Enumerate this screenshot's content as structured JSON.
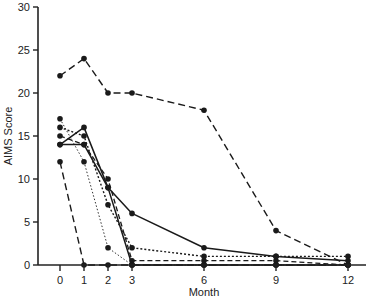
{
  "chart_data": {
    "type": "line",
    "title": "",
    "xlabel": "Month",
    "ylabel": "AIMS Score",
    "x": [
      0,
      1,
      2,
      3,
      6,
      9,
      12
    ],
    "x_ticks": [
      0,
      1,
      2,
      3,
      6,
      9,
      12
    ],
    "y_ticks": [
      0,
      5,
      10,
      15,
      20,
      25,
      30
    ],
    "ylim": [
      0,
      30
    ],
    "xlim": [
      -0.9,
      13
    ],
    "grid": false,
    "legend": null,
    "series": [
      {
        "name": "Patient A",
        "style": "longdash",
        "values": [
          22,
          24,
          20,
          20,
          18,
          4,
          0
        ]
      },
      {
        "name": "Patient B",
        "style": "solid",
        "values": [
          14,
          14,
          9,
          6,
          2,
          1,
          0.5
        ]
      },
      {
        "name": "Patient C",
        "style": "solid",
        "values": [
          14,
          16,
          9,
          0,
          0,
          0,
          0
        ]
      },
      {
        "name": "Patient D",
        "style": "dotted",
        "values": [
          16,
          15,
          7,
          2,
          1,
          1,
          1
        ]
      },
      {
        "name": "Patient E",
        "style": "thindotted",
        "values": [
          17,
          12,
          2,
          0,
          0,
          0,
          0
        ]
      },
      {
        "name": "Patient F",
        "style": "dash",
        "values": [
          15,
          14,
          10,
          0.5,
          0.5,
          0.5,
          0
        ]
      },
      {
        "name": "Patient G",
        "style": "longdash",
        "values": [
          12,
          0,
          0,
          0,
          0,
          0,
          0
        ]
      }
    ]
  },
  "labels": {
    "xlabel": "Month",
    "ylabel": "AIMS Score"
  }
}
